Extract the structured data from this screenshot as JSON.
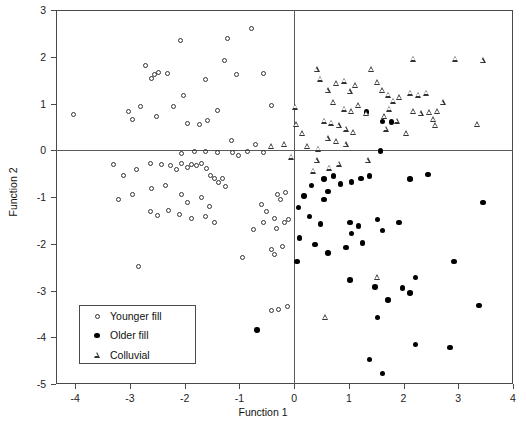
{
  "chart_data": {
    "type": "scatter",
    "title": "",
    "xlabel": "Function 1",
    "ylabel": "Function 2",
    "xlim": [
      -4.35,
      4.0
    ],
    "ylim": [
      -5.0,
      3.0
    ],
    "xticks": [
      -4,
      -3,
      -2,
      -1,
      0,
      1,
      2,
      3,
      4
    ],
    "xticklabels": [
      "-4",
      "-3",
      "-2",
      "-1",
      "0",
      "1",
      "2",
      "3",
      "4"
    ],
    "yticks": [
      3,
      2,
      1,
      0,
      -1,
      -2,
      -3,
      -4,
      -5
    ],
    "yticklabels": [
      "3",
      "2",
      "1",
      "0",
      "-1",
      "-2",
      "-3",
      "-4",
      "-5"
    ],
    "grid": false,
    "reference_lines": [
      {
        "axis": "x",
        "value": 0
      },
      {
        "axis": "y",
        "value": 0
      }
    ],
    "legend_position": "lower-left",
    "series": [
      {
        "name": "Younger fill",
        "marker": "open-circle",
        "color": "#333333",
        "points": [
          [
            -4.03,
            0.76
          ],
          [
            -3.03,
            0.83
          ],
          [
            -2.95,
            0.65
          ],
          [
            -2.72,
            1.82
          ],
          [
            -2.6,
            1.53
          ],
          [
            -2.55,
            1.63
          ],
          [
            -2.47,
            1.66
          ],
          [
            -2.32,
            1.64
          ],
          [
            -2.8,
            0.93
          ],
          [
            -2.08,
            2.35
          ],
          [
            -2.02,
            1.17
          ],
          [
            -1.95,
            0.57
          ],
          [
            -1.58,
            0.64
          ],
          [
            -1.22,
            2.38
          ],
          [
            -1.28,
            1.92
          ],
          [
            -1.05,
            1.63
          ],
          [
            -1.4,
            0.85
          ],
          [
            -0.77,
            2.6
          ],
          [
            -0.55,
            1.64
          ],
          [
            -1.62,
            1.52
          ],
          [
            -2.2,
            0.94
          ],
          [
            -2.52,
            0.72
          ],
          [
            -1.72,
            0.56
          ],
          [
            -1.15,
            0.2
          ],
          [
            -0.7,
            0.12
          ],
          [
            -0.42,
            0.95
          ],
          [
            -2.05,
            -0.07
          ],
          [
            -1.82,
            -0.02
          ],
          [
            -1.62,
            -0.03
          ],
          [
            -1.4,
            -0.04
          ],
          [
            -1.12,
            -0.05
          ],
          [
            -1.02,
            -0.12
          ],
          [
            -0.85,
            -0.03
          ],
          [
            -0.55,
            -0.05
          ],
          [
            -3.3,
            -0.3
          ],
          [
            -3.12,
            -0.55
          ],
          [
            -2.88,
            -0.42
          ],
          [
            -2.62,
            -0.28
          ],
          [
            -2.42,
            -0.3
          ],
          [
            -2.25,
            -0.33
          ],
          [
            -2.15,
            -0.42
          ],
          [
            -2.05,
            -0.28
          ],
          [
            -1.95,
            -0.36
          ],
          [
            -1.88,
            -0.3
          ],
          [
            -1.78,
            -0.32
          ],
          [
            -1.7,
            -0.28
          ],
          [
            -1.6,
            -0.4
          ],
          [
            -1.52,
            -0.55
          ],
          [
            -1.45,
            -0.6
          ],
          [
            -1.38,
            -0.7
          ],
          [
            -1.3,
            -0.6
          ],
          [
            -1.25,
            -0.78
          ],
          [
            -2.35,
            -0.75
          ],
          [
            -2.6,
            -0.82
          ],
          [
            -2.95,
            -0.95
          ],
          [
            -3.2,
            -1.05
          ],
          [
            -2.05,
            -0.95
          ],
          [
            -1.95,
            -1.12
          ],
          [
            -1.7,
            -1.0
          ],
          [
            -1.55,
            -1.2
          ],
          [
            -2.3,
            -1.28
          ],
          [
            -2.1,
            -1.38
          ],
          [
            -1.88,
            -1.45
          ],
          [
            -1.62,
            -1.42
          ],
          [
            -1.45,
            -1.55
          ],
          [
            -2.5,
            -1.4
          ],
          [
            -2.62,
            -1.3
          ],
          [
            -0.6,
            -1.15
          ],
          [
            -0.5,
            -1.32
          ],
          [
            -0.35,
            -1.45
          ],
          [
            -0.55,
            -1.55
          ],
          [
            -0.75,
            -1.7
          ],
          [
            -0.32,
            -1.68
          ],
          [
            -0.3,
            -0.95
          ],
          [
            -0.15,
            -0.9
          ],
          [
            -0.25,
            -1.05
          ],
          [
            -2.85,
            -2.48
          ],
          [
            -0.95,
            -2.3
          ],
          [
            -0.42,
            -2.12
          ],
          [
            -0.22,
            -2.05
          ],
          [
            -0.35,
            -2.22
          ],
          [
            -0.18,
            -1.55
          ],
          [
            -0.1,
            -1.48
          ],
          [
            -0.12,
            -3.35
          ],
          [
            -0.28,
            -3.4
          ],
          [
            -0.42,
            -3.42
          ]
        ]
      },
      {
        "name": "Older fill",
        "marker": "filled-circle",
        "color": "#000000",
        "points": [
          [
            1.32,
            0.82
          ],
          [
            1.62,
            0.62
          ],
          [
            1.78,
            0.6
          ],
          [
            1.58,
            -0.02
          ],
          [
            0.55,
            -0.62
          ],
          [
            0.32,
            -0.75
          ],
          [
            0.85,
            -0.72
          ],
          [
            0.72,
            -0.55
          ],
          [
            1.05,
            -0.68
          ],
          [
            1.22,
            -0.6
          ],
          [
            1.38,
            -0.55
          ],
          [
            0.62,
            -0.88
          ],
          [
            0.18,
            -0.98
          ],
          [
            0.08,
            -1.22
          ],
          [
            0.28,
            -1.42
          ],
          [
            0.48,
            -1.58
          ],
          [
            1.02,
            -1.55
          ],
          [
            1.18,
            -1.62
          ],
          [
            1.52,
            -1.48
          ],
          [
            1.62,
            -1.72
          ],
          [
            1.92,
            -1.55
          ],
          [
            0.1,
            -1.88
          ],
          [
            0.38,
            -2.02
          ],
          [
            0.62,
            -2.2
          ],
          [
            1.05,
            -1.78
          ],
          [
            0.95,
            -2.08
          ],
          [
            1.25,
            -1.98
          ],
          [
            0.05,
            -2.38
          ],
          [
            2.92,
            -2.38
          ],
          [
            1.02,
            -2.78
          ],
          [
            1.48,
            -2.92
          ],
          [
            2.22,
            -2.72
          ],
          [
            1.98,
            -2.95
          ],
          [
            2.12,
            -3.05
          ],
          [
            1.72,
            -3.2
          ],
          [
            1.52,
            -3.58
          ],
          [
            3.38,
            -3.32
          ],
          [
            2.22,
            -4.15
          ],
          [
            2.85,
            -4.22
          ],
          [
            1.38,
            -4.48
          ],
          [
            1.62,
            -4.78
          ],
          [
            -0.68,
            -3.85
          ],
          [
            3.45,
            -1.12
          ],
          [
            2.45,
            -0.52
          ],
          [
            2.12,
            -0.62
          ],
          [
            0.55,
            -1.05
          ]
        ]
      },
      {
        "name": "Colluvial",
        "marker": "open-triangle",
        "color": "#333333",
        "points": [
          [
            0.42,
            1.72
          ],
          [
            0.48,
            1.52
          ],
          [
            0.62,
            1.28
          ],
          [
            0.78,
            1.42
          ],
          [
            0.92,
            1.48
          ],
          [
            1.02,
            1.25
          ],
          [
            1.12,
            1.38
          ],
          [
            0.72,
            1.02
          ],
          [
            0.92,
            0.88
          ],
          [
            1.05,
            0.82
          ],
          [
            1.18,
            0.95
          ],
          [
            1.32,
            0.78
          ],
          [
            0.55,
            0.62
          ],
          [
            0.68,
            0.58
          ],
          [
            0.82,
            0.52
          ],
          [
            0.95,
            0.45
          ],
          [
            1.08,
            0.38
          ],
          [
            0.62,
            0.25
          ],
          [
            0.78,
            0.18
          ],
          [
            0.95,
            0.12
          ],
          [
            0.45,
            0.02
          ],
          [
            0.25,
            0.08
          ],
          [
            0.15,
            0.35
          ],
          [
            0.05,
            0.55
          ],
          [
            0.02,
            0.92
          ],
          [
            1.42,
            1.72
          ],
          [
            1.52,
            1.45
          ],
          [
            1.62,
            1.28
          ],
          [
            1.72,
            1.18
          ],
          [
            1.82,
            1.05
          ],
          [
            1.92,
            1.12
          ],
          [
            1.75,
            0.88
          ],
          [
            1.65,
            0.72
          ],
          [
            1.88,
            0.62
          ],
          [
            1.68,
            0.45
          ],
          [
            2.12,
            1.22
          ],
          [
            2.28,
            1.18
          ],
          [
            2.42,
            1.22
          ],
          [
            2.18,
            0.82
          ],
          [
            2.32,
            0.78
          ],
          [
            2.48,
            0.8
          ],
          [
            2.62,
            0.82
          ],
          [
            2.55,
            0.65
          ],
          [
            2.58,
            0.52
          ],
          [
            2.72,
            1.02
          ],
          [
            2.95,
            1.95
          ],
          [
            3.45,
            1.92
          ],
          [
            2.18,
            1.95
          ],
          [
            3.35,
            0.55
          ],
          [
            2.05,
            0.35
          ],
          [
            0.42,
            -0.22
          ],
          [
            0.65,
            -0.38
          ],
          [
            0.82,
            -0.3
          ],
          [
            0.35,
            -0.45
          ],
          [
            1.35,
            -0.22
          ],
          [
            0.58,
            -3.58
          ],
          [
            1.52,
            -2.72
          ],
          [
            -0.18,
            0.12
          ],
          [
            -0.42,
            0.08
          ],
          [
            -0.05,
            -0.15
          ]
        ]
      }
    ]
  },
  "legend": {
    "entries": [
      {
        "label": "Younger fill",
        "marker": "open-circle"
      },
      {
        "label": "Older fill",
        "marker": "filled-circle"
      },
      {
        "label": "Colluvial",
        "marker": "open-triangle"
      }
    ]
  }
}
